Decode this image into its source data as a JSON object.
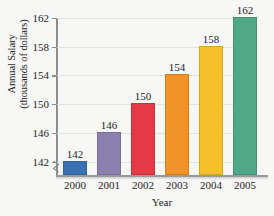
{
  "chart_data": {
    "type": "bar",
    "title": "",
    "xlabel": "Year",
    "ylabel": "Annual Salary (thousands of dollars)",
    "ylabel_lines": [
      "Annual Salary",
      "(thousands of dollars)"
    ],
    "categories": [
      "2000",
      "2001",
      "2002",
      "2003",
      "2004",
      "2005"
    ],
    "values": [
      142,
      146,
      150,
      154,
      158,
      162
    ],
    "value_labels": [
      "142",
      "146",
      "150",
      "154",
      "158",
      "162"
    ],
    "ylim": [
      140,
      162
    ],
    "yticks": [
      142,
      146,
      150,
      154,
      158,
      162
    ],
    "ytick_labels": [
      "142",
      "146",
      "150",
      "154",
      "158",
      "162"
    ],
    "grid": true,
    "legend": "none",
    "axis_break": true,
    "bar_colors": [
      "#3a6fb0",
      "#8b7fae",
      "#e63946",
      "#f39227",
      "#f5c028",
      "#4fa888"
    ],
    "series": [
      {
        "name": "Annual Salary",
        "points": [
          {
            "x": "2000",
            "y": 142,
            "color": "#3a6fb0"
          },
          {
            "x": "2001",
            "y": 146,
            "color": "#8b7fae"
          },
          {
            "x": "2002",
            "y": 150,
            "color": "#e63946"
          },
          {
            "x": "2003",
            "y": 154,
            "color": "#f39227"
          },
          {
            "x": "2004",
            "y": 158,
            "color": "#f5c028"
          },
          {
            "x": "2005",
            "y": 162,
            "color": "#4fa888"
          }
        ]
      }
    ]
  },
  "background_color": "#f7f7f5",
  "axis_color": "#8d8d8d",
  "grid_color": "#e2e2e0",
  "text_color": "#262626"
}
